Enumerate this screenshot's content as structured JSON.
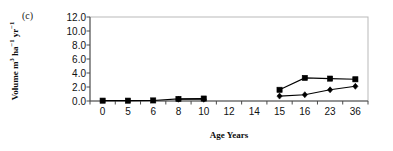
{
  "figure": {
    "panel_label": "(c)",
    "background": "#ffffff",
    "ink": "#000000"
  },
  "chart_data": {
    "type": "line",
    "title": "",
    "subtitle": "",
    "panel": "(c)",
    "xlabel": "Age Years",
    "ylabel": "Volume m3 ha-1 yr-1",
    "ylabel_parts": {
      "text_main": "Volume m",
      "sup1": "3",
      "text_mid": " ha",
      "sup2": "−1",
      "text_mid2": " yr",
      "sup3": "−1"
    },
    "categories": [
      "0",
      "5",
      "6",
      "8",
      "10",
      "12",
      "14",
      "15",
      "16",
      "23",
      "36"
    ],
    "ylim": [
      0.0,
      12.0
    ],
    "ytick_labels": [
      "0.0",
      "2.0",
      "4.0",
      "6.0",
      "8.0",
      "10.0",
      "12.0"
    ],
    "ytick_values": [
      0.0,
      2.0,
      4.0,
      6.0,
      8.0,
      10.0,
      12.0
    ],
    "grid": false,
    "legend": "none",
    "series": [
      {
        "name": "square-series",
        "marker": "square",
        "color": "#000000",
        "x": [
          "0",
          "5",
          "6",
          "8",
          "10",
          "15",
          "16",
          "23",
          "36"
        ],
        "values": [
          0.05,
          0.05,
          0.08,
          0.3,
          0.35,
          1.6,
          3.3,
          3.2,
          3.1
        ]
      },
      {
        "name": "diamond-series",
        "marker": "diamond",
        "color": "#000000",
        "x": [
          "8",
          "10",
          "15",
          "16",
          "23",
          "36"
        ],
        "values": [
          0.25,
          0.25,
          0.7,
          0.9,
          1.6,
          2.1
        ]
      }
    ]
  }
}
